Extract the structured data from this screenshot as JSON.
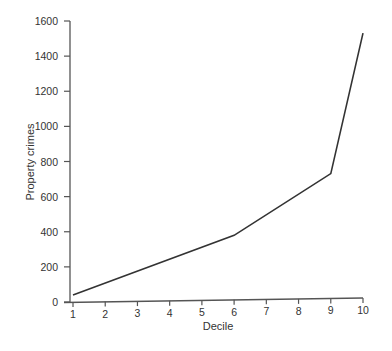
{
  "chart_data": {
    "type": "line",
    "title": "",
    "xlabel": "Decile",
    "ylabel": "Property crimes",
    "categories": [
      "1",
      "2",
      "3",
      "4",
      "5",
      "6",
      "7",
      "8",
      "9",
      "10"
    ],
    "x": [
      1,
      6,
      9,
      10
    ],
    "series": [
      {
        "name": "Property crimes",
        "x": [
          1,
          6,
          9,
          10
        ],
        "values": [
          40,
          370,
          720,
          1530
        ]
      }
    ],
    "ylim": [
      0,
      1600
    ],
    "yticks": [
      0,
      200,
      400,
      600,
      800,
      1000,
      1200,
      1400,
      1600
    ],
    "xticks": [
      1,
      2,
      3,
      4,
      5,
      6,
      7,
      8,
      9,
      10
    ],
    "grid": false,
    "legend": "none",
    "line_color": "#333333"
  }
}
